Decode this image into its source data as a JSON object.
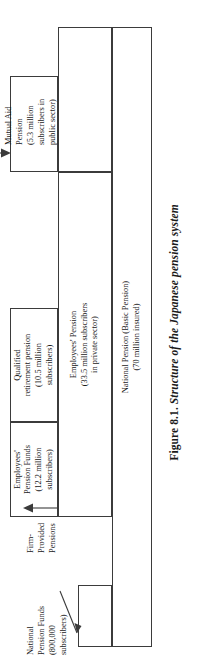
{
  "figure": {
    "caption_number": "Figure 8.1.",
    "caption_title": "Structure of the Japanese pension system"
  },
  "boxes": {
    "basic_pension": {
      "name": "National Pension (Basic Pension)",
      "line1": "National Pension (Basic Pension)",
      "line2": "(70 million insured)"
    },
    "employees_pension": {
      "name": "Employees' Pension",
      "line1": "Employees' Pension",
      "line2": "(33.5 million subscribers",
      "line3": "in private sector)"
    },
    "employees_pension_funds": {
      "name": "Employees' Pension Funds",
      "line1": "Employees'",
      "line2": "Pension Funds",
      "line3": "(12.2 million",
      "line4": "subscribers)"
    },
    "qualified_retirement_pension": {
      "name": "Qualified retirement pension",
      "line1": "Qualified",
      "line2": "retirement pension",
      "line3": "(10.5 million",
      "line4": "subscribers)"
    },
    "mutual_aid_band": {
      "name": "Mutual Aid Pension band",
      "text": ""
    },
    "mutual_aid_top": {
      "name": "Mutual Aid upper band",
      "text": ""
    },
    "national_pension_funds_box": {
      "name": "National Pension Funds box",
      "text": ""
    }
  },
  "callouts": {
    "national_pension_funds": {
      "line1": "National",
      "line2": "Pension Funds",
      "line3": "(800,000",
      "line4": "subscribers)"
    },
    "firm_provided_pensions": {
      "line1": "Firm-",
      "line2": "Provided",
      "line3": "Pensions"
    },
    "mutual_aid_pension": {
      "line1": "Mutual Aid",
      "line2": "Pension",
      "line3": "(5.3 million",
      "line4": "subscribers in",
      "line5": "public sector)"
    }
  },
  "colors": {
    "line": "#3b3b3b",
    "text": "#1a1a1a",
    "background": "#ffffff"
  }
}
